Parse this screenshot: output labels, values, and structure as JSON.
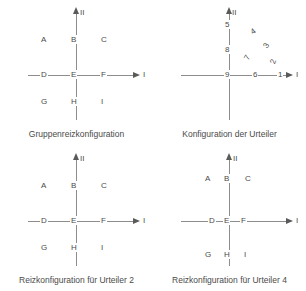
{
  "figure": {
    "background": "#ffffff",
    "line_color": "#8d8d8d",
    "text_color": "#4a4a4a"
  },
  "panels": [
    {
      "id": "gruppenreizkonfiguration",
      "caption": "Gruppenreizkonfiguration",
      "axis_x_label": "I",
      "axis_y_label": "II",
      "cells": [
        {
          "label": "A",
          "x": 43,
          "y": 40
        },
        {
          "label": "B",
          "x": 73,
          "y": 40
        },
        {
          "label": "C",
          "x": 103,
          "y": 40
        },
        {
          "label": "D",
          "x": 43,
          "y": 71
        },
        {
          "label": "E",
          "x": 73,
          "y": 71
        },
        {
          "label": "F",
          "x": 103,
          "y": 71
        },
        {
          "label": "G",
          "x": 43,
          "y": 101
        },
        {
          "label": "H",
          "x": 73,
          "y": 101
        },
        {
          "label": "I",
          "x": 103,
          "y": 101
        }
      ]
    },
    {
      "id": "konfiguration-der-urteiler",
      "caption": "Konfiguration der Urteiler",
      "axis_x_label": "I",
      "axis_y_label": "II",
      "axis_numbers": [
        {
          "label": "5",
          "x": 72,
          "y": 28
        },
        {
          "label": "8",
          "x": 72,
          "y": 53
        },
        {
          "label": "9",
          "x": 72,
          "y": 75
        },
        {
          "label": "6",
          "x": 102,
          "y": 75
        },
        {
          "label": "1",
          "x": 127,
          "y": 75
        }
      ],
      "arc_numbers": [
        {
          "label": "4",
          "x": 100,
          "y": 32,
          "rotation": -35
        },
        {
          "label": "3",
          "x": 113,
          "y": 46,
          "rotation": -55
        },
        {
          "label": "7",
          "x": 94,
          "y": 58,
          "rotation": -60
        },
        {
          "label": "2",
          "x": 120,
          "y": 62,
          "rotation": -70
        }
      ]
    },
    {
      "id": "reizkonfiguration-urteiler-2",
      "caption": "Reizkonfiguration für Urteiler 2",
      "axis_x_label": "I",
      "axis_y_label": "II",
      "cells": [
        {
          "label": "A",
          "x": 43,
          "y": 40
        },
        {
          "label": "B",
          "x": 73,
          "y": 40
        },
        {
          "label": "C",
          "x": 103,
          "y": 40
        },
        {
          "label": "D",
          "x": 43,
          "y": 71
        },
        {
          "label": "E",
          "x": 73,
          "y": 71
        },
        {
          "label": "F",
          "x": 103,
          "y": 71
        },
        {
          "label": "G",
          "x": 43,
          "y": 101
        },
        {
          "label": "H",
          "x": 73,
          "y": 101
        },
        {
          "label": "I",
          "x": 103,
          "y": 101
        }
      ]
    },
    {
      "id": "reizkonfiguration-urteiler-4",
      "caption": "Reizkonfiguration für Urteiler 4",
      "axis_x_label": "I",
      "axis_y_label": "II",
      "cells": [
        {
          "label": "A",
          "x": 54,
          "y": 33
        },
        {
          "label": "B",
          "x": 73,
          "y": 33
        },
        {
          "label": "C",
          "x": 94,
          "y": 33
        },
        {
          "label": "D",
          "x": 58,
          "y": 71
        },
        {
          "label": "E",
          "x": 73,
          "y": 71
        },
        {
          "label": "F",
          "x": 90,
          "y": 71
        },
        {
          "label": "G",
          "x": 54,
          "y": 108
        },
        {
          "label": "H",
          "x": 73,
          "y": 108
        },
        {
          "label": "I",
          "x": 92,
          "y": 108
        }
      ]
    }
  ]
}
